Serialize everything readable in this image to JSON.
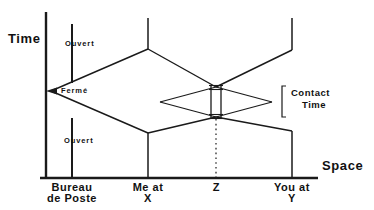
{
  "figure": {
    "kind": "spacetime-diagram",
    "stroke_color": "#1a1a1a",
    "background": "#ffffff"
  },
  "axes": {
    "time_label": "Time",
    "space_label": "Space"
  },
  "states": {
    "open_upper": "Ouvert",
    "closed": "Fermé",
    "open_lower": "Ouvert"
  },
  "annotations": {
    "contact_line1": "Contact",
    "contact_line2": "Time"
  },
  "locations": [
    {
      "id": "post-office",
      "line1": "Bureau",
      "line2": "de Poste"
    },
    {
      "id": "me",
      "line1": "Me at",
      "line2": "X"
    },
    {
      "id": "meeting-point",
      "line1": "Z",
      "line2": ""
    },
    {
      "id": "you",
      "line1": "You at",
      "line2": "Y"
    }
  ],
  "caption": " "
}
